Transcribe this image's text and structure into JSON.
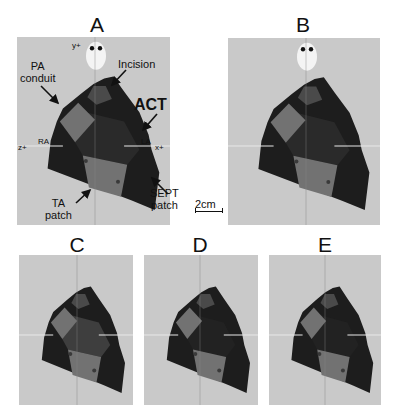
{
  "figure": {
    "panels": [
      {
        "id": "A",
        "label": "A",
        "box": {
          "x": 17,
          "y": 37,
          "w": 153,
          "h": 188
        },
        "label_pos": {
          "x": 97,
          "y": 15
        },
        "axis_x": 95,
        "axis_y": 146,
        "show_oval": true,
        "variant": "A"
      },
      {
        "id": "B",
        "label": "B",
        "box": {
          "x": 228,
          "y": 38,
          "w": 152,
          "h": 187
        },
        "label_pos": {
          "x": 303,
          "y": 15
        },
        "axis_x": 306,
        "axis_y": 146,
        "show_oval": true,
        "variant": "B"
      },
      {
        "id": "C",
        "label": "C",
        "box": {
          "x": 19,
          "y": 255,
          "w": 114,
          "h": 150
        },
        "label_pos": {
          "x": 77,
          "y": 236
        },
        "axis_x": 77,
        "axis_y": 335,
        "show_oval": false,
        "variant": "C"
      },
      {
        "id": "D",
        "label": "D",
        "box": {
          "x": 144,
          "y": 255,
          "w": 114,
          "h": 150
        },
        "label_pos": {
          "x": 200,
          "y": 236
        },
        "axis_x": 200,
        "axis_y": 335,
        "show_oval": false,
        "variant": "D"
      },
      {
        "id": "E",
        "label": "E",
        "box": {
          "x": 269,
          "y": 255,
          "w": 112,
          "h": 150
        },
        "label_pos": {
          "x": 325,
          "y": 236
        },
        "axis_x": 325,
        "axis_y": 335,
        "show_oval": false,
        "variant": "E"
      }
    ],
    "annotations": {
      "y_axis": "y+",
      "z_axis": "z+",
      "x_axis": "x+",
      "ra": "RA",
      "la": "LA",
      "pa_conduit_line1": "PA",
      "pa_conduit_line2": "conduit",
      "incision": "Incision",
      "act": "ACT",
      "sept_line1": "SEPT",
      "sept_line2": "patch",
      "ta_line1": "TA",
      "ta_line2": "patch"
    },
    "scale_bar": {
      "label": "2cm"
    },
    "colors": {
      "background": "#c9c9c9",
      "heart": "#1d1d1d",
      "patch": "#727272",
      "region_mid": "#3a3a3a",
      "oval": "#f4f4f4",
      "axis_line": "#e8e8e8"
    }
  }
}
